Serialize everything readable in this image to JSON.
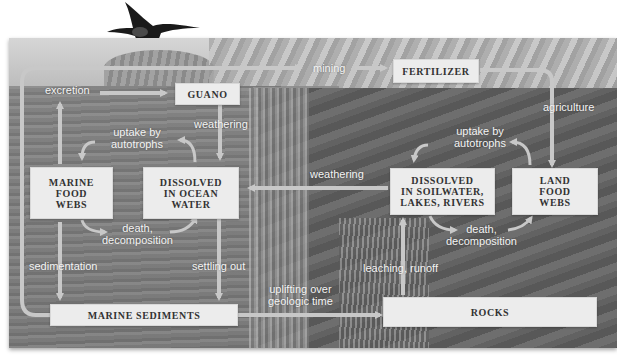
{
  "diagram": {
    "type": "phosphorus-cycle",
    "palette": {
      "box_fill": "#ececec",
      "box_text": "#333333",
      "arrow": "#c8c8c8",
      "label_text": "#f4f4f4"
    },
    "boxes": {
      "guano": "GUANO",
      "fertilizer": "FERTILIZER",
      "marine_food_webs": [
        "MARINE",
        "FOOD",
        "WEBS"
      ],
      "dissolved_ocean": [
        "DISSOLVED",
        "IN OCEAN",
        "WATER"
      ],
      "dissolved_soil": [
        "DISSOLVED",
        "IN SOILWATER,",
        "LAKES, RIVERS"
      ],
      "land_food_webs": [
        "LAND",
        "FOOD",
        "WEBS"
      ],
      "marine_sediments": "MARINE SEDIMENTS",
      "rocks": "ROCKS"
    },
    "labels": {
      "excretion": "excretion",
      "mining": "mining",
      "agriculture": "agriculture",
      "weathering_guano": "weathering",
      "uptake_marine": [
        "uptake by",
        "autotrophs"
      ],
      "uptake_land": [
        "uptake by",
        "autotrophs"
      ],
      "weathering_land": "weathering",
      "death_marine": [
        "death,",
        "decomposition"
      ],
      "death_land": [
        "death,",
        "decomposition"
      ],
      "sedimentation": "sedimentation",
      "settling_out": "settling out",
      "leaching": "leaching, runoff",
      "uplifting": [
        "uplifting over",
        "geologic time"
      ]
    }
  }
}
